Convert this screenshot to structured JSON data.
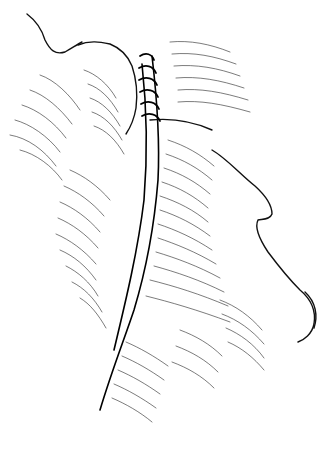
{
  "illustration": {
    "kind": "line-art surgical illustration",
    "subject": "sutured incision on neck/face in profile",
    "colors": {
      "background": "#ffffff",
      "ink": "#111111"
    },
    "elements": [
      "face-profile-contour",
      "ear-contour",
      "incision-line",
      "sutures",
      "skin-hatching"
    ]
  }
}
